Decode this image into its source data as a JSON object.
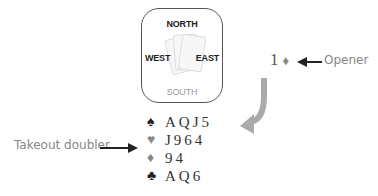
{
  "compass": {
    "north": "NORTH",
    "south": "SOUTH",
    "west": "WEST",
    "east": "EAST"
  },
  "bid": {
    "level": "1",
    "suit": "♦"
  },
  "labels": {
    "opener": "Opener",
    "doubler": "Takeout doubler"
  },
  "hand": [
    {
      "suit": "♠",
      "suit_name": "spades",
      "cards": "AQJ5",
      "color": "#222222"
    },
    {
      "suit": "♥",
      "suit_name": "hearts",
      "cards": "J964",
      "color": "#888888"
    },
    {
      "suit": "♦",
      "suit_name": "diamonds",
      "cards": "94",
      "color": "#888888"
    },
    {
      "suit": "♣",
      "suit_name": "clubs",
      "cards": "AQ6",
      "color": "#222222"
    }
  ]
}
